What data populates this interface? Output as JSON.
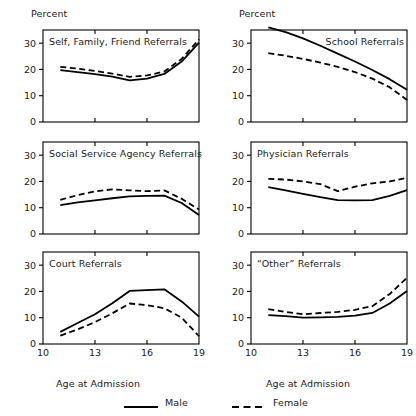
{
  "figure": {
    "percent_axis_label": "Percent",
    "x_axis_label": "Age at Admission"
  },
  "legend": {
    "male_label": "Male",
    "female_label": "Female",
    "male_style": "solid",
    "female_style": "dashed",
    "line_color": "#000000"
  },
  "axes": {
    "y_ticks": [
      "0",
      "10",
      "20",
      "30"
    ],
    "x_ticks": [
      "10",
      "13",
      "16",
      "19"
    ]
  },
  "chart_data": [
    {
      "type": "line",
      "title": "Self, Family, Friend  Referrals",
      "panel": "top-left",
      "xlabel": "Age at Admission",
      "ylabel": "Percent",
      "xlim": [
        10,
        19
      ],
      "ylim": [
        0,
        35
      ],
      "x": [
        11,
        12,
        13,
        14,
        15,
        16,
        17,
        18,
        19
      ],
      "series": [
        {
          "name": "Male",
          "style": "solid",
          "values": [
            19.7,
            19.0,
            18.2,
            17.3,
            15.8,
            16.5,
            18.3,
            23.0,
            30.2
          ]
        },
        {
          "name": "Female",
          "style": "dashed",
          "values": [
            21.0,
            20.3,
            19.4,
            18.4,
            17.2,
            17.7,
            19.2,
            24.0,
            31.4
          ]
        }
      ]
    },
    {
      "type": "line",
      "title": "School Referrals",
      "panel": "top-right",
      "xlabel": "Age at Admission",
      "ylabel": "Percent",
      "xlim": [
        10,
        19
      ],
      "ylim": [
        0,
        35
      ],
      "x": [
        11,
        12,
        13,
        14,
        15,
        16,
        17,
        18,
        19
      ],
      "series": [
        {
          "name": "Male",
          "style": "solid",
          "values": [
            36.0,
            34.2,
            31.8,
            29.0,
            26.0,
            23.0,
            19.8,
            16.3,
            12.3
          ]
        },
        {
          "name": "Female",
          "style": "dashed",
          "values": [
            26.2,
            25.2,
            24.0,
            22.6,
            21.0,
            19.0,
            16.5,
            13.2,
            8.4
          ]
        }
      ]
    },
    {
      "type": "line",
      "title": "Social Service Agency Referrals",
      "panel": "middle-left",
      "xlabel": "Age at Admission",
      "ylabel": "Percent",
      "xlim": [
        10,
        19
      ],
      "ylim": [
        0,
        35
      ],
      "x": [
        11,
        12,
        13,
        14,
        15,
        16,
        17,
        18,
        19
      ],
      "series": [
        {
          "name": "Male",
          "style": "solid",
          "values": [
            11.0,
            12.0,
            12.8,
            13.6,
            14.3,
            14.5,
            14.6,
            11.8,
            7.2
          ]
        },
        {
          "name": "Female",
          "style": "dashed",
          "values": [
            13.0,
            14.8,
            16.2,
            17.0,
            16.6,
            16.3,
            16.6,
            13.4,
            9.3
          ]
        }
      ]
    },
    {
      "type": "line",
      "title": "Physician Referrals",
      "panel": "middle-right",
      "xlabel": "Age at Admission",
      "ylabel": "Percent",
      "xlim": [
        10,
        19
      ],
      "ylim": [
        0,
        35
      ],
      "x": [
        11,
        12,
        13,
        14,
        15,
        16,
        17,
        18,
        19
      ],
      "series": [
        {
          "name": "Male",
          "style": "solid",
          "values": [
            17.8,
            16.6,
            15.3,
            14.0,
            12.9,
            12.8,
            12.9,
            14.5,
            16.7
          ]
        },
        {
          "name": "Female",
          "style": "dashed",
          "values": [
            21.0,
            20.7,
            20.0,
            19.0,
            16.3,
            18.0,
            19.3,
            20.0,
            21.4
          ]
        }
      ]
    },
    {
      "type": "line",
      "title": "Court Referrals",
      "panel": "bottom-left",
      "xlabel": "Age at Admission",
      "ylabel": "Percent",
      "xlim": [
        10,
        19
      ],
      "ylim": [
        0,
        35
      ],
      "x": [
        11,
        12,
        13,
        14,
        15,
        16,
        17,
        18,
        19
      ],
      "series": [
        {
          "name": "Male",
          "style": "solid",
          "values": [
            4.6,
            8.0,
            11.3,
            15.5,
            20.2,
            20.5,
            20.8,
            16.2,
            10.4
          ]
        },
        {
          "name": "Female",
          "style": "dashed",
          "values": [
            3.2,
            5.6,
            8.3,
            11.7,
            15.4,
            14.8,
            13.6,
            10.0,
            3.0
          ]
        }
      ]
    },
    {
      "type": "line",
      "title": "“Other” Referrals",
      "panel": "bottom-right",
      "xlabel": "Age at Admission",
      "ylabel": "Percent",
      "xlim": [
        10,
        19
      ],
      "ylim": [
        0,
        35
      ],
      "x": [
        11,
        12,
        13,
        14,
        15,
        16,
        17,
        18,
        19
      ],
      "series": [
        {
          "name": "Male",
          "style": "solid",
          "values": [
            11.0,
            10.6,
            10.0,
            10.1,
            10.3,
            10.8,
            11.8,
            15.4,
            20.2
          ]
        },
        {
          "name": "Female",
          "style": "dashed",
          "values": [
            13.3,
            12.2,
            11.3,
            11.8,
            12.2,
            13.0,
            14.4,
            19.0,
            25.2
          ]
        }
      ]
    }
  ]
}
